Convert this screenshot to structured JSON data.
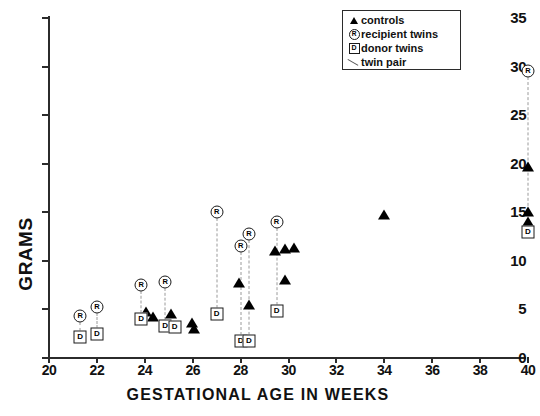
{
  "chart_data": {
    "type": "scatter",
    "title": "",
    "xlabel": "GESTATIONAL AGE IN WEEKS",
    "ylabel": "GRAMS",
    "xlim": [
      20,
      40
    ],
    "ylim": [
      0,
      35
    ],
    "xticks": [
      20,
      22,
      24,
      26,
      28,
      30,
      32,
      34,
      36,
      38,
      40
    ],
    "yticks": [
      0,
      5,
      10,
      15,
      20,
      25,
      30,
      35
    ],
    "grid": false,
    "legend_position": "top-right",
    "legend": [
      {
        "symbol": "filled-triangle",
        "label": "controls"
      },
      {
        "symbol": "circled-R",
        "label": "recipient  twins"
      },
      {
        "symbol": "boxed-D",
        "label": "donor  twins"
      },
      {
        "symbol": "dashed-line",
        "label": "twin  pair"
      }
    ],
    "series": [
      {
        "name": "controls",
        "marker": "filled-triangle",
        "points": [
          {
            "x": 24.05,
            "y": 4.7
          },
          {
            "x": 24.35,
            "y": 4.2
          },
          {
            "x": 25.1,
            "y": 4.5
          },
          {
            "x": 25.95,
            "y": 3.6
          },
          {
            "x": 26.05,
            "y": 3.0
          },
          {
            "x": 27.95,
            "y": 7.7
          },
          {
            "x": 28.35,
            "y": 5.5
          },
          {
            "x": 29.45,
            "y": 11.0
          },
          {
            "x": 29.85,
            "y": 11.2
          },
          {
            "x": 30.25,
            "y": 11.3
          },
          {
            "x": 29.85,
            "y": 8.0
          },
          {
            "x": 34.0,
            "y": 14.7
          },
          {
            "x": 40.0,
            "y": 19.7
          },
          {
            "x": 40.0,
            "y": 15.0
          },
          {
            "x": 40.0,
            "y": 14.0
          }
        ]
      },
      {
        "name": "recipient twins",
        "marker": "circled-R",
        "points": [
          {
            "x": 21.3,
            "y": 4.3
          },
          {
            "x": 22.0,
            "y": 5.3
          },
          {
            "x": 23.85,
            "y": 7.5
          },
          {
            "x": 24.85,
            "y": 7.8
          },
          {
            "x": 27.0,
            "y": 15.0
          },
          {
            "x": 28.0,
            "y": 11.5
          },
          {
            "x": 28.35,
            "y": 12.8
          },
          {
            "x": 29.5,
            "y": 14.0
          },
          {
            "x": 40.0,
            "y": 29.5
          }
        ]
      },
      {
        "name": "donor twins",
        "marker": "boxed-D",
        "points": [
          {
            "x": 21.3,
            "y": 2.2
          },
          {
            "x": 22.0,
            "y": 2.5
          },
          {
            "x": 23.85,
            "y": 4.0
          },
          {
            "x": 24.85,
            "y": 3.3
          },
          {
            "x": 25.25,
            "y": 3.2
          },
          {
            "x": 27.0,
            "y": 4.5
          },
          {
            "x": 28.0,
            "y": 1.8
          },
          {
            "x": 28.35,
            "y": 1.8
          },
          {
            "x": 29.5,
            "y": 4.8
          },
          {
            "x": 40.0,
            "y": 13.0
          }
        ]
      }
    ],
    "twin_pairs": [
      {
        "x": 21.3,
        "recipient": 4.3,
        "donor": 2.2
      },
      {
        "x": 22.0,
        "recipient": 5.3,
        "donor": 2.5
      },
      {
        "x": 23.85,
        "recipient": 7.5,
        "donor": 4.0
      },
      {
        "x": 24.85,
        "recipient": 7.8,
        "donor": 3.3
      },
      {
        "x": 27.0,
        "recipient": 15.0,
        "donor": 4.5
      },
      {
        "x": 28.0,
        "recipient": 11.5,
        "donor": 1.8
      },
      {
        "x": 28.35,
        "recipient": 12.8,
        "donor": 1.8
      },
      {
        "x": 29.5,
        "recipient": 14.0,
        "donor": 4.8
      },
      {
        "x": 40.0,
        "recipient": 29.5,
        "donor": 13.0
      }
    ]
  },
  "markers": {
    "recipient_glyph": "R",
    "donor_glyph": "D"
  }
}
